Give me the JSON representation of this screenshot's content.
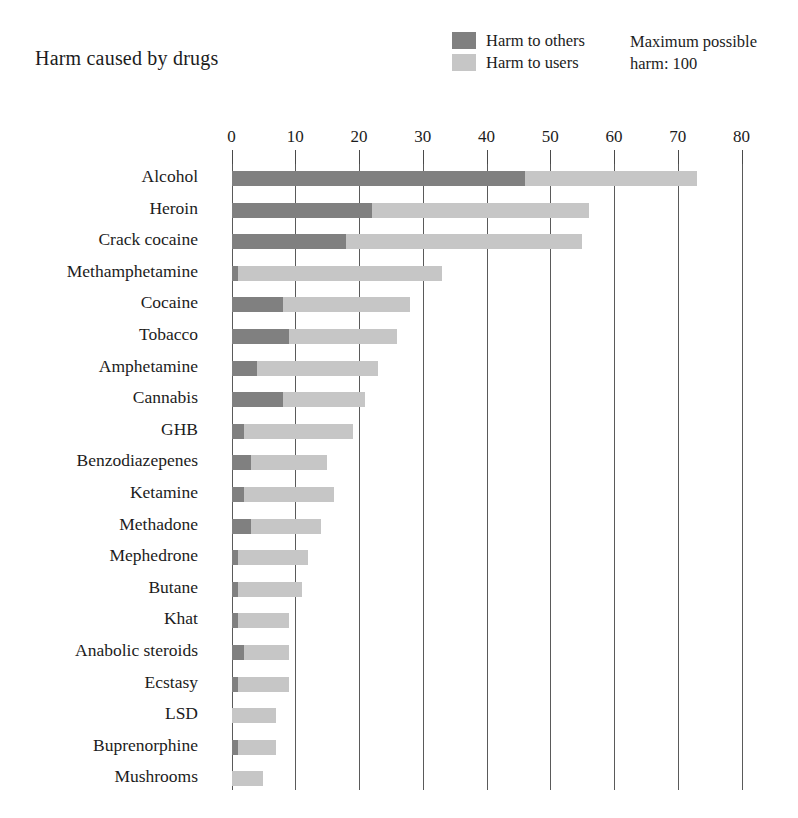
{
  "chart_data": {
    "type": "bar",
    "orientation": "horizontal",
    "stacked": true,
    "title": "Harm caused by drugs",
    "xlabel": "",
    "ylabel": "",
    "xlim": [
      0,
      80
    ],
    "xticks": [
      0,
      10,
      20,
      30,
      40,
      50,
      60,
      70,
      80
    ],
    "xtick_labels": [
      "0",
      "10",
      "20",
      "30",
      "40",
      "50",
      "60",
      "70",
      "80"
    ],
    "grid": true,
    "legend_position": "top-center",
    "annotation": "Maximum possible harm: 100",
    "categories": [
      "Alcohol",
      "Heroin",
      "Crack cocaine",
      "Methamphetamine",
      "Cocaine",
      "Tobacco",
      "Amphetamine",
      "Cannabis",
      "GHB",
      "Benzodiazepenes",
      "Ketamine",
      "Methadone",
      "Mephedrone",
      "Butane",
      "Khat",
      "Anabolic steroids",
      "Ecstasy",
      "LSD",
      "Buprenorphine",
      "Mushrooms"
    ],
    "series": [
      {
        "name": "Harm to others",
        "color": "#808080",
        "values": [
          46,
          22,
          18,
          1,
          8,
          9,
          4,
          8,
          2,
          3,
          2,
          3,
          1,
          1,
          1,
          2,
          1,
          0,
          1,
          0
        ]
      },
      {
        "name": "Harm to users",
        "color": "#c6c6c6",
        "values": [
          27,
          34,
          37,
          32,
          20,
          17,
          19,
          13,
          17,
          12,
          14,
          11,
          11,
          10,
          8,
          7,
          8,
          7,
          6,
          5
        ]
      }
    ],
    "totals": [
      73,
      56,
      55,
      33,
      28,
      26,
      23,
      21,
      19,
      15,
      16,
      14,
      12,
      11,
      9,
      9,
      9,
      7,
      7,
      5
    ]
  },
  "header": {
    "title": "Harm caused by drugs",
    "max_harm_line1": "Maximum possible",
    "max_harm_line2": "harm: 100"
  },
  "legend": {
    "items": [
      {
        "label": "Harm to others",
        "color": "#808080"
      },
      {
        "label": "Harm to users",
        "color": "#c6c6c6"
      }
    ]
  },
  "colors": {
    "harm_to_others": "#808080",
    "harm_to_users": "#c6c6c6",
    "gridline": "#5a5a5a",
    "text": "#1c1c1c",
    "background": "#ffffff"
  }
}
